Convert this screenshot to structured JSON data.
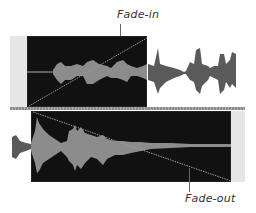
{
  "annotations": {
    "fade_in_label": "Fade-in",
    "fade_out_label": "Fade-out"
  },
  "tracks": [
    {
      "name": "upper-track",
      "clip": "fade-in clip",
      "fade": "fade-in"
    },
    {
      "name": "lower-track",
      "clip": "fade-out clip",
      "fade": "fade-out"
    }
  ],
  "colors": {
    "clip_background": "#111111",
    "waveform_in_clip": "#8c8c8c",
    "waveform_outside": "#5a5a5a",
    "fade_line": "#9a9a9a",
    "track_background": "#e6e6e6"
  }
}
